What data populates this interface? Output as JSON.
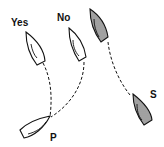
{
  "labels": {
    "yes": "Yes",
    "no": "No",
    "p": "P",
    "s": "S"
  },
  "colors": {
    "line": "#111111",
    "background": "#ffffff"
  }
}
